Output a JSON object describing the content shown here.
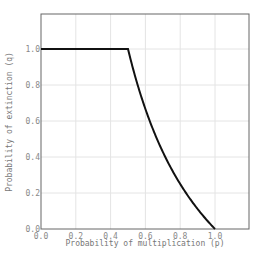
{
  "chart_data": {
    "type": "line",
    "title": "",
    "xlabel": "Probability of multiplication (p)",
    "ylabel": "Probability of extinction (q)",
    "xlim": [
      0,
      1.2
    ],
    "ylim": [
      0,
      1.2
    ],
    "xticks": [
      "0.0",
      "0.2",
      "0.4",
      "0.6",
      "0.8",
      "1.0"
    ],
    "yticks": [
      "0.0",
      "0.2",
      "0.4",
      "0.6",
      "0.8",
      "1.0"
    ],
    "grid": true,
    "legend": null,
    "series": [
      {
        "name": "q",
        "formula": "q = 1 for p <= 0.5; q = (1-p)/p for p > 0.5",
        "x": [
          0.0,
          0.1,
          0.2,
          0.3,
          0.4,
          0.5,
          0.55,
          0.6,
          0.65,
          0.7,
          0.75,
          0.8,
          0.85,
          0.9,
          0.95,
          1.0
        ],
        "y": [
          1.0,
          1.0,
          1.0,
          1.0,
          1.0,
          1.0,
          0.818,
          0.667,
          0.538,
          0.429,
          0.333,
          0.25,
          0.176,
          0.111,
          0.053,
          0.0
        ],
        "color": "#111111"
      }
    ]
  }
}
